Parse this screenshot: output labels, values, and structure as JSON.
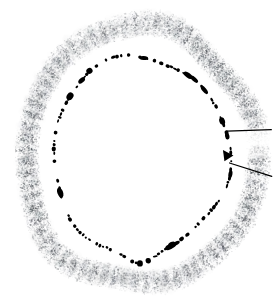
{
  "figure": {
    "title": "Transverse cross-section micrograph",
    "background_color": "#ffffff",
    "width": 280,
    "height": 305
  },
  "geometry": {
    "center_x": 140,
    "center_y": 155,
    "outer_band_outer_radius_x": 128,
    "outer_band_outer_radius_y": 142,
    "outer_band_inner_radius_x": 104,
    "outer_band_inner_radius_y": 116,
    "inner_contour_radius_x": 88,
    "inner_contour_radius_y": 98
  },
  "outer_band": {
    "name": "stippled-cortical-band",
    "fill_color": "#9aa0a6",
    "stipple_color": "#4b4f55",
    "striation_color": "#3a3d42",
    "striation_count": 34,
    "stipple_density": 14000,
    "opacity_mean": 0.42
  },
  "inner_contour": {
    "name": "broken-dark-contour",
    "color": "#000000",
    "style": "dashed-irregular",
    "segment_count": 150,
    "apex_top": true,
    "apex_bottom": true
  },
  "incision_marker": {
    "name": "radial-incision",
    "color": "#000000",
    "angle_upper_degrees": 347,
    "angle_lower_degrees": 4,
    "wedge_present": true,
    "line_width": 1.2
  },
  "colors": {
    "ink": "#000000",
    "gray_mid": "#8b9097",
    "gray_dark": "#3a3d42",
    "paper": "#ffffff"
  },
  "labels": {
    "figure_label": "",
    "scale_bar": "",
    "annotations": []
  }
}
